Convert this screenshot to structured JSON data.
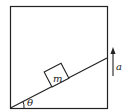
{
  "diagram": {
    "labels": {
      "mass": "m",
      "angle": "θ",
      "acceleration": "a"
    },
    "colors": {
      "line": "#222222",
      "background": "#ffffff"
    }
  }
}
